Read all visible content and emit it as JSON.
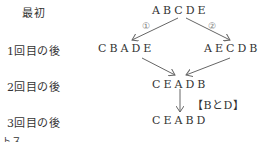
{
  "rows": {
    "initial_label": "最初",
    "after1_label": "1回目の後",
    "after2_label": "2回目の後",
    "after3_label": "3回目の後"
  },
  "sequences": {
    "initial": "ABCDE",
    "after1_left": "CBADE",
    "after1_right": "AECDB",
    "after2": "CEADB",
    "after3": "CEABD"
  },
  "branch_labels": {
    "left": "①",
    "right": "②"
  },
  "swap_note": "【BとD】",
  "footer_fragment": "トス"
}
